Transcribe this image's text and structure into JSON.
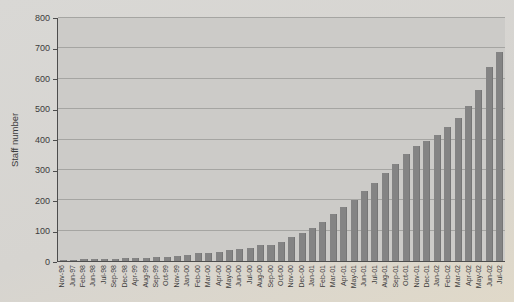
{
  "chart_data": {
    "type": "bar",
    "title": "",
    "xlabel": "",
    "ylabel": "Staff number",
    "ylim": [
      0,
      800
    ],
    "yticks": [
      0,
      100,
      200,
      300,
      400,
      500,
      600,
      700,
      800
    ],
    "grid": true,
    "legend_position": "none",
    "bar_color": "#848484",
    "plot_bg": "#cccbc8",
    "page_bg": "#d7d5d1",
    "categories": [
      "Nov-96",
      "Jun-97",
      "Feb-98",
      "Jun-98",
      "Jul-98",
      "Sep-98",
      "Dec-98",
      "Apr-99",
      "Aug-99",
      "Sep-99",
      "Oct-99",
      "Nov-99",
      "Jan-00",
      "Feb-00",
      "Mar-00",
      "Apr-00",
      "May-00",
      "Jun-00",
      "Jul-00",
      "Aug-00",
      "Sep-00",
      "Oct-00",
      "Nov-00",
      "Dec-00",
      "Jan-01",
      "Feb-01",
      "Mar-01",
      "Apr-01",
      "May-01",
      "Jun-01",
      "Jul-01",
      "Aug-01",
      "Sep-01",
      "Oct-01",
      "Nov-01",
      "Dec-01",
      "Jan-02",
      "Feb-02",
      "Mar-02",
      "Apr-02",
      "May-02",
      "Jun-02",
      "Jul-02"
    ],
    "values": [
      3,
      4,
      5,
      6,
      7,
      8,
      9,
      10,
      11,
      12,
      14,
      16,
      21,
      25,
      28,
      30,
      35,
      41,
      42,
      52,
      54,
      63,
      78,
      92,
      110,
      130,
      155,
      178,
      200,
      230,
      258,
      290,
      320,
      352,
      380,
      396,
      416,
      440,
      470,
      510,
      562,
      640,
      688
    ]
  }
}
